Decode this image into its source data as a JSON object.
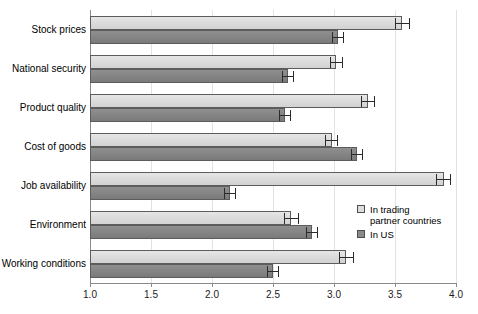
{
  "chart_data": {
    "type": "bar",
    "orientation": "horizontal",
    "title": "",
    "xlabel": "",
    "ylabel": "",
    "xlim": [
      1.0,
      4.0
    ],
    "xticks": [
      "1.0",
      "1.5",
      "2.0",
      "2.5",
      "3.0",
      "3.5",
      "4.0"
    ],
    "xtick_values": [
      1.0,
      1.5,
      2.0,
      2.5,
      3.0,
      3.5,
      4.0
    ],
    "grid": "vertical",
    "legend_position": "right-middle",
    "categories": [
      "Stock prices",
      "National security",
      "Product quality",
      "Cost of goods",
      "Job availability",
      "Environment",
      "Working conditions"
    ],
    "series": [
      {
        "name": "In trading\npartner countries",
        "color": "#dcdcdc",
        "values": [
          3.56,
          3.02,
          3.28,
          2.98,
          3.9,
          2.65,
          3.1
        ],
        "errors": [
          0.06,
          0.05,
          0.06,
          0.05,
          0.06,
          0.06,
          0.06
        ]
      },
      {
        "name": "In US",
        "color": "#8a8a8a",
        "values": [
          3.03,
          2.62,
          2.6,
          3.19,
          2.15,
          2.82,
          2.5
        ],
        "errors": [
          0.05,
          0.05,
          0.05,
          0.05,
          0.05,
          0.05,
          0.05
        ]
      }
    ]
  },
  "legend": {
    "items": [
      {
        "label": "In trading\npartner countries",
        "swatch": "light"
      },
      {
        "label": "In US",
        "swatch": "dark"
      }
    ]
  }
}
